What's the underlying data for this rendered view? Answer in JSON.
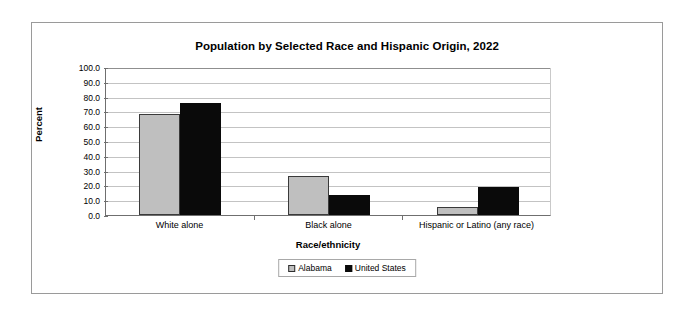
{
  "chart_data": {
    "type": "bar",
    "title": "Population by Selected Race and Hispanic Origin, 2022",
    "xlabel": "Race/ethnicity",
    "ylabel": "Percent",
    "categories": [
      "White alone",
      "Black alone",
      "Hispanic or Latino (any race)"
    ],
    "series": [
      {
        "name": "Alabama",
        "color": "#bfbfbf",
        "values": [
          68.5,
          26.6,
          5.3
        ]
      },
      {
        "name": "United States",
        "color": "#0a0a0a",
        "values": [
          75.5,
          13.6,
          19.1
        ]
      }
    ],
    "ylim": [
      0,
      100
    ],
    "ytick_labels": [
      "100.0",
      "90.0",
      "80.0",
      "70.0",
      "60.0",
      "50.0",
      "40.0",
      "30.0",
      "20.0",
      "10.0",
      "0.0"
    ],
    "ytick_values": [
      100,
      90,
      80,
      70,
      60,
      50,
      40,
      30,
      20,
      10,
      0
    ],
    "grid": true,
    "legend_position": "bottom"
  },
  "frame": {
    "border_color": "#9a9a9a"
  }
}
